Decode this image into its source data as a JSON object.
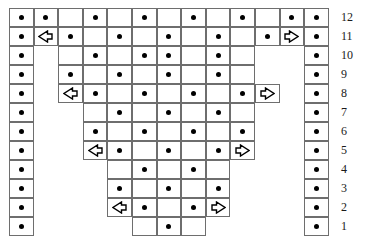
{
  "chart": {
    "title": "",
    "type": "knitting-stitch-chart",
    "columns": 13,
    "rows": 12,
    "cell_width": 24.6,
    "cell_height": 19.0,
    "origin_x": 9,
    "origin_y": 8,
    "grid_color": "#6e6e6e",
    "symbol_color": "#000000",
    "background": "#ffffff",
    "symbols": {
      "dot": "•",
      "arrow_left": "⇦",
      "arrow_right": "⇨",
      "empty": ""
    },
    "row_numbers": [
      "12",
      "11",
      "10",
      "9",
      "8",
      "7",
      "6",
      "5",
      "4",
      "3",
      "2",
      "1"
    ],
    "row_number_x": 341,
    "grid": [
      {
        "row": "12",
        "first_col": 1,
        "last_col": 13,
        "cells": [
          "dot",
          "dot",
          "empty",
          "dot",
          "empty",
          "dot",
          "empty",
          "dot",
          "empty",
          "dot",
          "empty",
          "dot",
          "dot"
        ]
      },
      {
        "row": "11",
        "first_col": 1,
        "last_col": 13,
        "cells": [
          "dot",
          "arrow_left",
          "dot",
          "empty",
          "dot",
          "empty",
          "dot",
          "empty",
          "dot",
          "empty",
          "dot",
          "arrow_right",
          "dot"
        ]
      },
      {
        "row": "10",
        "first_col": 1,
        "last_col": 13,
        "cells": [
          "dot",
          "gap",
          "empty",
          "dot",
          "empty",
          "dot",
          "dot",
          "empty",
          "dot",
          "empty",
          "gap",
          "gap",
          "dot"
        ]
      },
      {
        "row": "9",
        "first_col": 1,
        "last_col": 13,
        "cells": [
          "dot",
          "gap",
          "dot",
          "empty",
          "dot",
          "empty",
          "dot",
          "empty",
          "dot",
          "empty",
          "gap",
          "gap",
          "dot"
        ]
      },
      {
        "row": "8",
        "first_col": 1,
        "last_col": 13,
        "cells": [
          "dot",
          "gap",
          "arrow_left",
          "dot",
          "empty",
          "dot",
          "empty",
          "dot",
          "empty",
          "dot",
          "arrow_right",
          "gap",
          "dot"
        ]
      },
      {
        "row": "7",
        "first_col": 1,
        "last_col": 13,
        "cells": [
          "dot",
          "gap",
          "gap",
          "empty",
          "dot",
          "empty",
          "dot",
          "empty",
          "dot",
          "empty",
          "gap",
          "gap",
          "dot"
        ]
      },
      {
        "row": "6",
        "first_col": 1,
        "last_col": 13,
        "cells": [
          "dot",
          "gap",
          "gap",
          "dot",
          "empty",
          "dot",
          "empty",
          "dot",
          "empty",
          "dot",
          "gap",
          "gap",
          "dot"
        ]
      },
      {
        "row": "5",
        "first_col": 1,
        "last_col": 13,
        "cells": [
          "dot",
          "gap",
          "gap",
          "arrow_left",
          "dot",
          "empty",
          "dot",
          "empty",
          "dot",
          "arrow_right",
          "gap",
          "gap",
          "dot"
        ]
      },
      {
        "row": "4",
        "first_col": 1,
        "last_col": 13,
        "cells": [
          "dot",
          "gap",
          "gap",
          "gap",
          "empty",
          "dot",
          "empty",
          "dot",
          "empty",
          "gap",
          "gap",
          "gap",
          "dot"
        ]
      },
      {
        "row": "3",
        "first_col": 1,
        "last_col": 13,
        "cells": [
          "dot",
          "gap",
          "gap",
          "gap",
          "dot",
          "empty",
          "dot",
          "empty",
          "dot",
          "gap",
          "gap",
          "gap",
          "dot"
        ]
      },
      {
        "row": "2",
        "first_col": 1,
        "last_col": 13,
        "cells": [
          "dot",
          "gap",
          "gap",
          "gap",
          "arrow_left",
          "dot",
          "empty",
          "dot",
          "arrow_right",
          "gap",
          "gap",
          "gap",
          "dot"
        ]
      },
      {
        "row": "1",
        "first_col": 1,
        "last_col": 13,
        "cells": [
          "dot",
          "gap",
          "gap",
          "gap",
          "gap",
          "empty",
          "dot",
          "empty",
          "gap",
          "gap",
          "gap",
          "gap",
          "dot"
        ]
      }
    ]
  }
}
